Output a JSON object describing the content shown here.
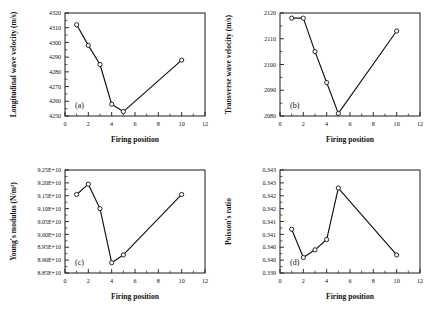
{
  "figure": {
    "panels": [
      "a",
      "b",
      "c",
      "d"
    ],
    "shared_xlabel": "Firing position"
  },
  "chart_data": [
    {
      "type": "line",
      "panel": "(a)",
      "title": "",
      "xlabel": "Firing position",
      "ylabel": "Longitudinal wave velocity (m/s)",
      "x": [
        1,
        2,
        3,
        4,
        5,
        10
      ],
      "values": [
        4312,
        4298,
        4285,
        4258,
        4253,
        4288
      ],
      "xlim": [
        0,
        12
      ],
      "ylim": [
        4250,
        4320
      ],
      "xticks": [
        0,
        2,
        4,
        6,
        8,
        10,
        12
      ],
      "xticklabels": [
        "0",
        "2",
        "4",
        "6",
        "8",
        "10",
        "12"
      ],
      "yticks": [
        4250,
        4260,
        4270,
        4280,
        4290,
        4300,
        4310,
        4320
      ],
      "yticklabels": [
        "4250",
        "4260",
        "4270",
        "4280",
        "4290",
        "4300",
        "4310",
        "4320"
      ],
      "grid": false,
      "legend": "none",
      "marker": "open-circle"
    },
    {
      "type": "line",
      "panel": "(b)",
      "title": "",
      "xlabel": "Firing position",
      "ylabel": "Transverse wave velocity (m/s)",
      "x": [
        1,
        2,
        3,
        4,
        5,
        10
      ],
      "values": [
        2118,
        2118,
        2105,
        2093,
        2081,
        2113
      ],
      "xlim": [
        0,
        12
      ],
      "ylim": [
        2080,
        2120
      ],
      "xticks": [
        0,
        2,
        4,
        6,
        8,
        10,
        12
      ],
      "xticklabels": [
        "0",
        "2",
        "4",
        "6",
        "8",
        "10",
        "12"
      ],
      "yticks": [
        2080,
        2090,
        2100,
        2110,
        2120
      ],
      "yticklabels": [
        "2080",
        "2090",
        "2100",
        "2110",
        "2120"
      ],
      "grid": false,
      "legend": "none",
      "marker": "open-circle"
    },
    {
      "type": "line",
      "panel": "(c)",
      "title": "",
      "xlabel": "Firing position",
      "ylabel": "Young's modulus (N/m²)",
      "x": [
        1,
        2,
        3,
        4,
        5,
        10
      ],
      "values": [
        91550000000,
        91950000000,
        91000000000,
        88900000000,
        89200000000,
        91550000000
      ],
      "xlim": [
        0,
        12
      ],
      "ylim": [
        88500000000,
        92500000000
      ],
      "xticks": [
        0,
        2,
        4,
        6,
        8,
        10,
        12
      ],
      "xticklabels": [
        "0",
        "2",
        "4",
        "6",
        "8",
        "10",
        "12"
      ],
      "yticks": [
        88500000000,
        89000000000,
        89500000000,
        90000000000,
        90500000000,
        91000000000,
        91500000000,
        92000000000,
        92500000000
      ],
      "yticklabels": [
        "8.85E+10",
        "8.90E+10",
        "8.95E+10",
        "9.00E+10",
        "9.05E+10",
        "9.10E+10",
        "9.15E+10",
        "9.20E+10",
        "9.25E+10"
      ],
      "grid": false,
      "legend": "none",
      "marker": "open-circle"
    },
    {
      "type": "line",
      "panel": "(d)",
      "title": "",
      "xlabel": "Firing position",
      "ylabel": "Poisson's ratio",
      "x": [
        1,
        2,
        3,
        4,
        5,
        10
      ],
      "values": [
        0.3412,
        0.3401,
        0.3404,
        0.3408,
        0.3428,
        0.3402
      ],
      "xlim": [
        0,
        12
      ],
      "ylim": [
        0.3395,
        0.3435
      ],
      "xticks": [
        0,
        2,
        4,
        6,
        8,
        10,
        12
      ],
      "xticklabels": [
        "0",
        "2",
        "4",
        "6",
        "8",
        "10",
        "12"
      ],
      "yticks": [
        0.3395,
        0.34,
        0.3405,
        0.341,
        0.3415,
        0.342,
        0.3425,
        0.343,
        0.3435
      ],
      "yticklabels": [
        "0.339",
        "0.340",
        "0.340",
        "0.341",
        "0.341",
        "0.342",
        "0.342",
        "0.343",
        "0.343"
      ],
      "grid": false,
      "legend": "none",
      "marker": "open-circle"
    }
  ]
}
